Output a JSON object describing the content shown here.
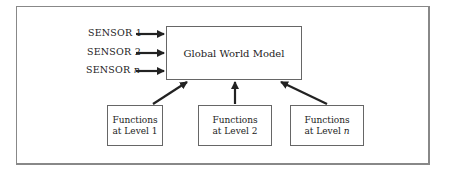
{
  "diagram": {
    "central": {
      "label": "Global World Model"
    },
    "sensors": [
      {
        "prefix": "SENSOR ",
        "suffix": "1",
        "italic": false
      },
      {
        "prefix": "SENSOR ",
        "suffix": "2",
        "italic": false
      },
      {
        "prefix": "SENSOR ",
        "suffix": "n",
        "italic": true
      }
    ],
    "functions": [
      {
        "line1": "Functions",
        "line2_prefix": "at Level ",
        "line2_suffix": "1"
      },
      {
        "line1": "Functions",
        "line2_prefix": "at Level ",
        "line2_suffix": "2"
      },
      {
        "line1": "Functions",
        "line2_prefix": "at Level ",
        "line2_suffix": "n"
      }
    ],
    "colors": {
      "line": "#222222",
      "frame": "#888888"
    }
  }
}
